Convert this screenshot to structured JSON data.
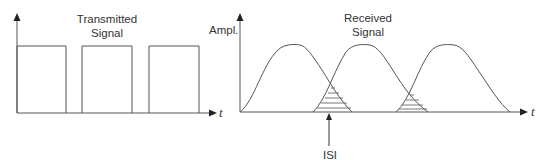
{
  "left_panel": {
    "title_line1": "Transmitted",
    "title_line2": "Signal",
    "x_axis_label": "t",
    "pulses": [
      {
        "x_start": 17,
        "x_end": 66
      },
      {
        "x_start": 82,
        "x_end": 132
      },
      {
        "x_start": 149,
        "x_end": 199
      }
    ]
  },
  "right_panel": {
    "y_axis_label": "Ampl.",
    "title_line1": "Received",
    "title_line2": "Signal",
    "x_axis_label": "t",
    "annotation": "ISI"
  },
  "colors": {
    "line": "#555555",
    "text": "#333333",
    "background": "#ffffff"
  }
}
